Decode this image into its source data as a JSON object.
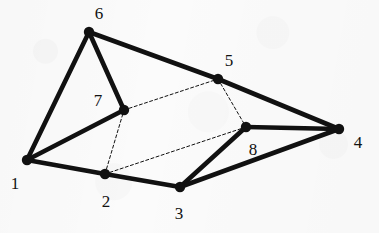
{
  "figure": {
    "kind": "undirected-graph",
    "width": 379,
    "height": 233,
    "background_color": "#fbfbfb",
    "ink_color": "#111111",
    "solid_edge_width": 4.6,
    "dashed_edge_width": 1.0,
    "dashed_pattern": "3 2.4",
    "node_radius": 5.2
  },
  "nodes": [
    {
      "id": "1",
      "label": "1",
      "x": 27,
      "y": 160,
      "label_x": 15,
      "label_y": 183
    },
    {
      "id": "2",
      "label": "2",
      "x": 105,
      "y": 174,
      "label_x": 106,
      "label_y": 201
    },
    {
      "id": "3",
      "label": "3",
      "x": 180,
      "y": 187,
      "label_x": 179,
      "label_y": 213
    },
    {
      "id": "4",
      "label": "4",
      "x": 339,
      "y": 129,
      "label_x": 358,
      "label_y": 142
    },
    {
      "id": "5",
      "label": "5",
      "x": 218,
      "y": 79,
      "label_x": 229,
      "label_y": 60
    },
    {
      "id": "6",
      "label": "6",
      "x": 89,
      "y": 32,
      "label_x": 99,
      "label_y": 13
    },
    {
      "id": "7",
      "label": "7",
      "x": 124,
      "y": 110,
      "label_x": 98,
      "label_y": 100
    },
    {
      "id": "8",
      "label": "8",
      "x": 246,
      "y": 127,
      "label_x": 253,
      "label_y": 149
    }
  ],
  "edges": [
    {
      "from": "1",
      "to": "6",
      "style": "solid"
    },
    {
      "from": "1",
      "to": "7",
      "style": "solid"
    },
    {
      "from": "1",
      "to": "2",
      "style": "solid"
    },
    {
      "from": "6",
      "to": "7",
      "style": "solid"
    },
    {
      "from": "6",
      "to": "5",
      "style": "solid"
    },
    {
      "from": "5",
      "to": "4",
      "style": "solid"
    },
    {
      "from": "2",
      "to": "3",
      "style": "solid"
    },
    {
      "from": "3",
      "to": "8",
      "style": "solid"
    },
    {
      "from": "3",
      "to": "4",
      "style": "solid"
    },
    {
      "from": "8",
      "to": "4",
      "style": "solid"
    },
    {
      "from": "7",
      "to": "5",
      "style": "dashed"
    },
    {
      "from": "5",
      "to": "8",
      "style": "dashed"
    },
    {
      "from": "8",
      "to": "2",
      "style": "dashed"
    },
    {
      "from": "2",
      "to": "7",
      "style": "dashed"
    }
  ]
}
